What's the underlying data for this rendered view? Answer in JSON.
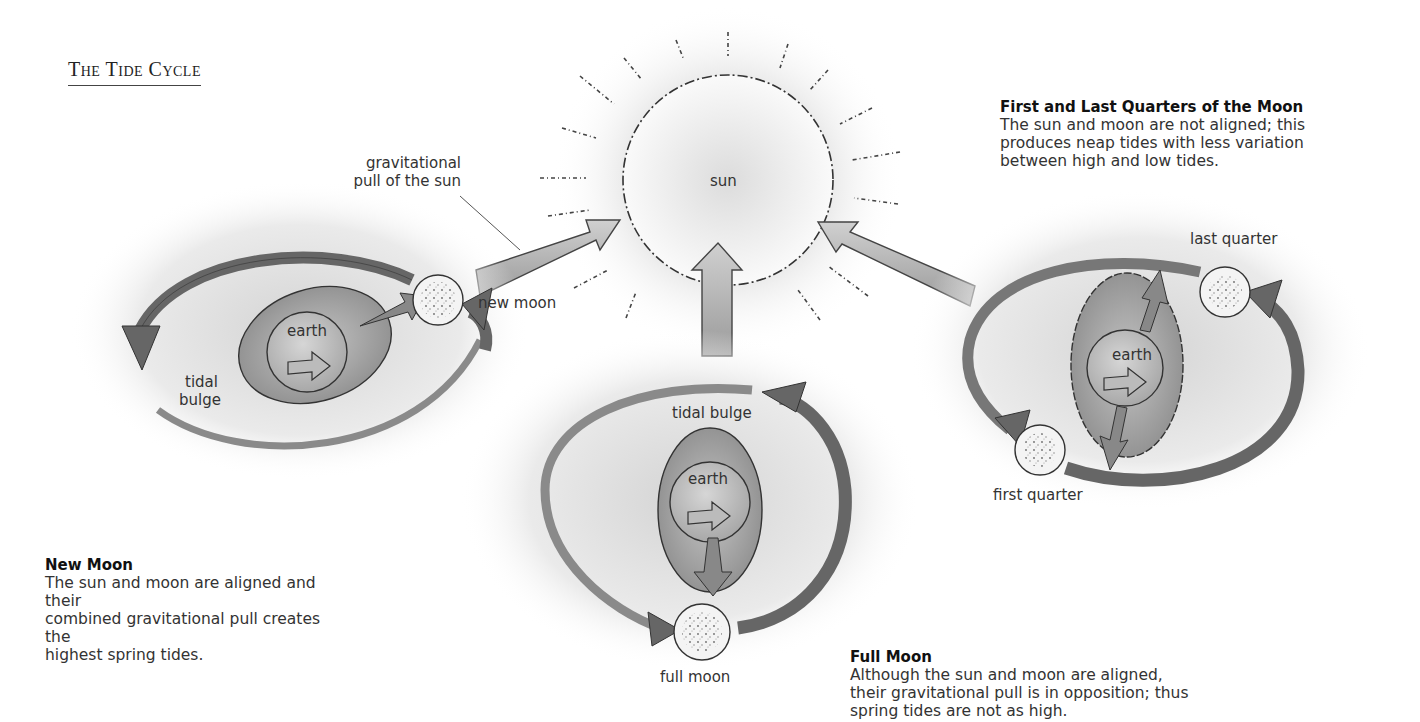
{
  "title": "The Tide Cycle",
  "labels": {
    "sun": "sun",
    "gravitational_pull_line1": "gravitational",
    "gravitational_pull_line2": "pull  of the sun",
    "new_moon": "new moon",
    "earth_new": "earth",
    "tidal_bulge_new_line1": "tidal",
    "tidal_bulge_new_line2": "bulge",
    "tidal_bulge_full": "tidal bulge",
    "earth_full": "earth",
    "full_moon": "full moon",
    "earth_quarter": "earth",
    "last_quarter": "last quarter",
    "first_quarter": "first quarter"
  },
  "sections": {
    "new_moon": {
      "heading": "New Moon",
      "lines": [
        "The sun and moon are aligned and their",
        "combined gravitational pull creates the",
        "highest spring tides."
      ]
    },
    "full_moon": {
      "heading": "Full Moon",
      "lines": [
        "Although the sun and moon are aligned,",
        "their gravitational pull is in opposition; thus",
        "spring tides are not as high."
      ]
    },
    "quarters": {
      "heading": "First and Last Quarters of the Moon",
      "lines": [
        "The sun and moon are not aligned; this",
        "produces neap tides with less variation",
        "between high and low tides."
      ]
    }
  },
  "colors": {
    "background": "#ffffff",
    "arrow_fill": "#7a7a7a",
    "bulge_fill": "#9a9a9a",
    "line": "#333333"
  }
}
